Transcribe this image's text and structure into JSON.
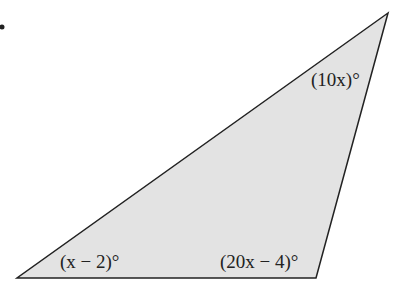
{
  "figure": {
    "type": "triangle",
    "fill_color": "#e3e3e3",
    "stroke_color": "#222222",
    "vertices": {
      "top_right": [
        388,
        13
      ],
      "bottom_left": [
        17,
        278
      ],
      "bottom_right": [
        316,
        278
      ]
    },
    "angles": [
      {
        "vertex": "top_right",
        "label": "(10x)°"
      },
      {
        "vertex": "bottom_left",
        "label": "(x − 2)°"
      },
      {
        "vertex": "bottom_right",
        "label": "(20x − 4)°"
      }
    ]
  }
}
